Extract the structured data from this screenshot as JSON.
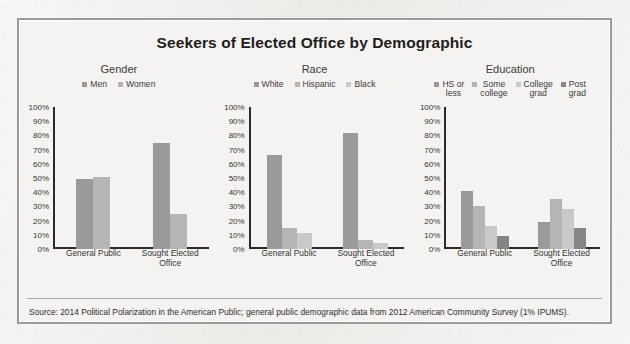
{
  "figure": {
    "title": "Seekers of Elected Office by Demographic",
    "source": "Source: 2014 Political Polarization in the American Public; general public demographic data from 2012 American Community Survey (1% IPUMS).",
    "ytick_labels": [
      "100%",
      "90%",
      "80%",
      "70%",
      "60%",
      "50%",
      "40%",
      "30%",
      "20%",
      "10%",
      "0%"
    ],
    "categories": [
      "General Public",
      "Sought Elected\nOffice"
    ]
  },
  "colors": {
    "bar_medium": "#9a9a9a",
    "bar_light": "#b5b5b5",
    "bar_lighter": "#c9c9c9",
    "bar_dark": "#858585",
    "axis": "#2b2b2b",
    "frame": "#9b9b99",
    "paper": "#f4f3f1"
  },
  "panels": [
    {
      "name": "gender",
      "title": "Gender",
      "legend": [
        {
          "label": "Men",
          "color": "#9a9a9a"
        },
        {
          "label": "Women",
          "color": "#b5b5b5"
        }
      ]
    },
    {
      "name": "race",
      "title": "Race",
      "legend": [
        {
          "label": "White",
          "color": "#9a9a9a"
        },
        {
          "label": "Hispanic",
          "color": "#b5b5b5"
        },
        {
          "label": "Black",
          "color": "#c9c9c9"
        }
      ]
    },
    {
      "name": "education",
      "title": "Education",
      "legend": [
        {
          "label": "HS or\nless",
          "color": "#9a9a9a"
        },
        {
          "label": "Some\ncollege",
          "color": "#b5b5b5"
        },
        {
          "label": "College\ngrad",
          "color": "#c9c9c9"
        },
        {
          "label": "Post\ngrad",
          "color": "#858585"
        }
      ]
    }
  ],
  "chart_data": [
    {
      "type": "bar",
      "title": "Gender",
      "categories": [
        "General Public",
        "Sought Elected Office"
      ],
      "series": [
        {
          "name": "Men",
          "values": [
            49,
            75
          ],
          "color": "#9a9a9a"
        },
        {
          "name": "Women",
          "values": [
            51,
            25
          ],
          "color": "#b5b5b5"
        }
      ],
      "xlabel": "",
      "ylabel": "",
      "ylim": [
        0,
        100
      ],
      "ytick_step": 10,
      "grid": false,
      "legend_position": "top"
    },
    {
      "type": "bar",
      "title": "Race",
      "categories": [
        "General Public",
        "Sought Elected Office"
      ],
      "series": [
        {
          "name": "White",
          "values": [
            66,
            82
          ],
          "color": "#9a9a9a"
        },
        {
          "name": "Hispanic",
          "values": [
            15,
            6
          ],
          "color": "#b5b5b5"
        },
        {
          "name": "Black",
          "values": [
            11,
            4
          ],
          "color": "#c9c9c9"
        }
      ],
      "xlabel": "",
      "ylabel": "",
      "ylim": [
        0,
        100
      ],
      "ytick_step": 10,
      "grid": false,
      "legend_position": "top"
    },
    {
      "type": "bar",
      "title": "Education",
      "categories": [
        "General Public",
        "Sought Elected Office"
      ],
      "series": [
        {
          "name": "HS or less",
          "values": [
            41,
            19
          ],
          "color": "#9a9a9a"
        },
        {
          "name": "Some college",
          "values": [
            30,
            35
          ],
          "color": "#b5b5b5"
        },
        {
          "name": "College grad",
          "values": [
            16,
            28
          ],
          "color": "#c9c9c9"
        },
        {
          "name": "Post grad",
          "values": [
            9,
            15
          ],
          "color": "#858585"
        }
      ],
      "xlabel": "",
      "ylabel": "",
      "ylim": [
        0,
        100
      ],
      "ytick_step": 10,
      "grid": false,
      "legend_position": "top"
    }
  ]
}
